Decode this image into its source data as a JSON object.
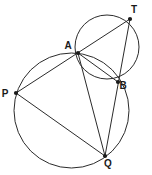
{
  "figure": {
    "background_color": "#ffffff",
    "stroke_color": "#2b2b2b",
    "label_color": "#1a1a1a",
    "canvas": {
      "width": 152,
      "height": 175
    }
  },
  "circles": [
    {
      "name": "large-circle",
      "cx": 71.5,
      "cy": 110.5,
      "r": 57.5,
      "label": ""
    },
    {
      "name": "small-circle",
      "cx": 107,
      "cy": 47,
      "r": 32,
      "label": ""
    }
  ],
  "points": [
    {
      "id": "T",
      "label": "T",
      "x": 130,
      "y": 19,
      "label_x": 134,
      "label_y": 13,
      "on": "small-circle"
    },
    {
      "id": "A",
      "label": "A",
      "x": 78,
      "y": 53,
      "label_x": 68,
      "label_y": 49,
      "on": "both-circles-intersection"
    },
    {
      "id": "B",
      "label": "B",
      "x": 118,
      "y": 82,
      "label_x": 123,
      "label_y": 89,
      "on": "both-circles-intersection"
    },
    {
      "id": "P",
      "label": "P",
      "x": 16,
      "y": 93,
      "label_x": 5,
      "label_y": 97,
      "on": "large-circle"
    },
    {
      "id": "Q",
      "label": "Q",
      "x": 105,
      "y": 156,
      "label_x": 108,
      "label_y": 167,
      "on": "large-circle"
    }
  ],
  "segments": [
    {
      "name": "segment-P-T",
      "from": "P",
      "to": "T",
      "passes_through": "A"
    },
    {
      "name": "segment-Q-T",
      "from": "Q",
      "to": "T",
      "passes_through": "B"
    },
    {
      "name": "segment-P-Q",
      "from": "P",
      "to": "Q",
      "passes_through": ""
    },
    {
      "name": "segment-A-B",
      "from": "A",
      "to": "B",
      "passes_through": ""
    },
    {
      "name": "segment-A-Q",
      "from": "A",
      "to": "Q",
      "passes_through": ""
    }
  ]
}
